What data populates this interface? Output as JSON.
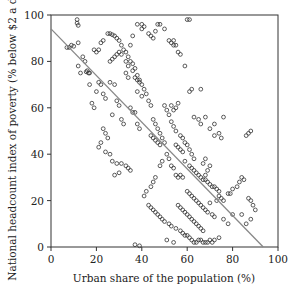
{
  "chart_data": {
    "type": "scatter",
    "title": "",
    "xlabel": "Urban share of the population (%)",
    "ylabel": "National headcount index of poverty (% below $2 a day)",
    "xlim": [
      0,
      100
    ],
    "ylim": [
      0,
      100
    ],
    "xticks": [
      0,
      20,
      40,
      60,
      80,
      100
    ],
    "yticks": [
      0,
      20,
      40,
      60,
      80,
      100
    ],
    "grid": false,
    "legend": null,
    "marker": "open-circle",
    "colors": {
      "marker": "#333333",
      "line": "#888888",
      "axis": "#333333"
    },
    "fit_line": {
      "x": [
        0,
        93.5
      ],
      "y": [
        94,
        0
      ]
    },
    "points": [
      [
        11.5,
        98
      ],
      [
        11.5,
        96.5
      ],
      [
        12,
        95.5
      ],
      [
        8,
        86
      ],
      [
        9,
        87
      ],
      [
        10,
        86.5
      ],
      [
        7,
        86
      ],
      [
        12,
        88
      ],
      [
        15,
        80
      ],
      [
        16,
        76
      ],
      [
        14,
        82
      ],
      [
        12,
        78
      ],
      [
        15.5,
        75.5
      ],
      [
        16.5,
        75
      ],
      [
        17,
        75
      ],
      [
        13,
        75
      ],
      [
        20,
        84
      ],
      [
        19,
        85
      ],
      [
        21,
        85
      ],
      [
        22,
        88
      ],
      [
        23,
        89
      ],
      [
        25,
        92
      ],
      [
        26,
        92
      ],
      [
        28,
        91
      ],
      [
        27,
        91.5
      ],
      [
        29,
        90
      ],
      [
        30,
        89
      ],
      [
        31,
        87
      ],
      [
        30,
        84
      ],
      [
        29,
        83
      ],
      [
        28,
        82
      ],
      [
        27,
        81
      ],
      [
        26,
        80
      ],
      [
        31,
        83
      ],
      [
        32,
        85
      ],
      [
        33,
        84
      ],
      [
        34,
        82
      ],
      [
        35,
        87
      ],
      [
        36,
        91
      ],
      [
        38,
        96
      ],
      [
        40,
        96
      ],
      [
        41,
        95
      ],
      [
        40,
        94
      ],
      [
        43,
        92
      ],
      [
        44,
        91
      ],
      [
        45,
        90
      ],
      [
        46,
        93
      ],
      [
        47,
        96
      ],
      [
        48,
        96
      ],
      [
        50,
        94
      ],
      [
        52,
        89
      ],
      [
        53,
        88
      ],
      [
        54,
        87
      ],
      [
        54,
        89
      ],
      [
        55,
        87
      ],
      [
        56,
        84
      ],
      [
        60,
        98
      ],
      [
        61,
        98
      ],
      [
        57,
        83
      ],
      [
        59,
        78
      ],
      [
        35,
        80
      ],
      [
        36,
        79
      ],
      [
        37,
        77
      ],
      [
        38,
        74
      ],
      [
        39,
        72
      ],
      [
        40,
        70
      ],
      [
        41,
        68
      ],
      [
        42,
        66
      ],
      [
        43,
        63
      ],
      [
        44,
        61
      ],
      [
        33,
        80
      ],
      [
        34,
        78
      ],
      [
        36,
        76
      ],
      [
        37,
        73
      ],
      [
        38,
        72
      ],
      [
        39,
        71
      ],
      [
        33,
        75
      ],
      [
        34,
        73
      ],
      [
        38,
        67
      ],
      [
        40,
        65
      ],
      [
        21,
        71
      ],
      [
        22,
        70
      ],
      [
        20,
        67
      ],
      [
        23,
        66
      ],
      [
        24,
        64
      ],
      [
        18,
        62
      ],
      [
        19,
        60
      ],
      [
        17,
        70
      ],
      [
        26,
        71
      ],
      [
        28,
        70
      ],
      [
        29,
        63
      ],
      [
        30,
        61
      ],
      [
        27,
        57
      ],
      [
        31,
        55
      ],
      [
        32,
        53
      ],
      [
        35,
        60
      ],
      [
        36,
        58
      ],
      [
        37,
        58
      ],
      [
        38,
        53
      ],
      [
        39,
        51
      ],
      [
        23,
        51
      ],
      [
        24,
        49
      ],
      [
        25,
        47
      ],
      [
        22,
        45
      ],
      [
        21,
        43
      ],
      [
        24,
        41
      ],
      [
        26,
        40
      ],
      [
        27,
        37
      ],
      [
        29,
        36
      ],
      [
        31,
        36
      ],
      [
        33,
        35
      ],
      [
        34,
        34
      ],
      [
        35,
        33
      ],
      [
        30,
        32
      ],
      [
        28,
        31
      ],
      [
        44,
        48
      ],
      [
        45,
        47
      ],
      [
        46,
        46
      ],
      [
        47,
        45
      ],
      [
        48,
        44
      ],
      [
        45,
        55
      ],
      [
        46,
        53
      ],
      [
        47,
        51
      ],
      [
        48,
        49
      ],
      [
        49,
        47
      ],
      [
        50,
        45
      ],
      [
        50,
        61
      ],
      [
        51,
        59
      ],
      [
        52,
        57
      ],
      [
        53,
        54
      ],
      [
        53,
        61
      ],
      [
        54,
        59
      ],
      [
        55,
        60
      ],
      [
        56,
        62
      ],
      [
        54,
        52
      ],
      [
        55,
        50
      ],
      [
        57,
        48
      ],
      [
        58,
        47
      ],
      [
        59,
        45
      ],
      [
        60,
        44
      ],
      [
        55,
        44
      ],
      [
        56,
        43
      ],
      [
        57,
        42
      ],
      [
        58,
        41
      ],
      [
        61,
        42
      ],
      [
        62,
        40
      ],
      [
        63,
        38
      ],
      [
        63,
        56
      ],
      [
        65,
        55
      ],
      [
        66,
        53
      ],
      [
        61,
        67
      ],
      [
        62,
        68
      ],
      [
        66,
        68
      ],
      [
        68,
        56
      ],
      [
        70,
        51
      ],
      [
        72,
        53
      ],
      [
        74,
        49
      ],
      [
        75,
        47
      ],
      [
        72,
        48
      ],
      [
        76,
        56
      ],
      [
        59,
        37
      ],
      [
        61,
        35
      ],
      [
        62,
        34
      ],
      [
        63,
        33
      ],
      [
        64,
        32
      ],
      [
        65,
        31
      ],
      [
        66,
        30
      ],
      [
        67,
        29
      ],
      [
        68,
        29
      ],
      [
        69,
        28
      ],
      [
        70,
        27
      ],
      [
        71,
        26
      ],
      [
        73,
        25
      ],
      [
        74,
        24
      ],
      [
        72,
        26
      ],
      [
        68,
        31
      ],
      [
        69,
        33
      ],
      [
        70,
        35
      ],
      [
        68,
        38
      ],
      [
        67,
        36
      ],
      [
        55,
        31
      ],
      [
        56,
        30
      ],
      [
        57,
        31
      ],
      [
        58,
        30
      ],
      [
        54,
        34
      ],
      [
        53,
        35
      ],
      [
        52,
        38
      ],
      [
        51,
        40
      ],
      [
        49,
        37
      ],
      [
        48,
        35
      ],
      [
        46,
        30
      ],
      [
        45,
        28
      ],
      [
        44,
        26
      ],
      [
        42,
        24
      ],
      [
        41,
        22
      ],
      [
        43,
        18
      ],
      [
        44,
        17
      ],
      [
        45,
        16
      ],
      [
        46,
        15
      ],
      [
        47,
        14
      ],
      [
        48,
        13
      ],
      [
        49,
        12
      ],
      [
        50,
        11
      ],
      [
        52,
        10
      ],
      [
        53,
        9
      ],
      [
        55,
        8
      ],
      [
        57,
        7
      ],
      [
        58,
        6
      ],
      [
        59,
        5
      ],
      [
        60,
        5
      ],
      [
        61,
        4
      ],
      [
        62,
        3
      ],
      [
        63,
        2
      ],
      [
        64,
        2
      ],
      [
        65,
        3
      ],
      [
        66,
        3
      ],
      [
        67,
        2
      ],
      [
        68,
        2
      ],
      [
        69,
        2
      ],
      [
        70,
        3
      ],
      [
        54,
        2
      ],
      [
        51,
        3
      ],
      [
        37,
        1
      ],
      [
        39,
        0.5
      ],
      [
        56,
        18
      ],
      [
        57,
        17
      ],
      [
        58,
        16
      ],
      [
        59,
        15
      ],
      [
        60,
        14
      ],
      [
        61,
        13
      ],
      [
        62,
        12
      ],
      [
        63,
        11
      ],
      [
        64,
        10
      ],
      [
        65,
        9
      ],
      [
        66,
        8
      ],
      [
        67,
        7
      ],
      [
        60,
        24
      ],
      [
        61,
        23
      ],
      [
        62,
        22
      ],
      [
        63,
        21
      ],
      [
        64,
        20
      ],
      [
        65,
        19
      ],
      [
        66,
        18
      ],
      [
        67,
        17
      ],
      [
        68,
        16
      ],
      [
        69,
        15
      ],
      [
        71,
        14
      ],
      [
        72,
        13
      ],
      [
        70,
        19
      ],
      [
        73,
        20
      ],
      [
        74,
        22
      ],
      [
        75,
        21
      ],
      [
        76,
        20
      ],
      [
        78,
        23
      ],
      [
        79,
        23
      ],
      [
        80,
        25
      ],
      [
        82,
        26
      ],
      [
        83,
        28
      ],
      [
        84,
        30
      ],
      [
        85,
        29
      ],
      [
        87,
        21
      ],
      [
        88,
        20
      ],
      [
        89,
        18
      ],
      [
        90,
        16
      ],
      [
        88,
        12
      ],
      [
        86,
        10
      ],
      [
        78,
        10
      ],
      [
        80,
        14
      ],
      [
        84,
        14
      ],
      [
        86,
        48
      ],
      [
        87,
        49
      ],
      [
        88,
        50
      ],
      [
        76,
        12
      ],
      [
        74,
        4
      ],
      [
        72,
        3
      ],
      [
        71,
        2
      ]
    ]
  }
}
